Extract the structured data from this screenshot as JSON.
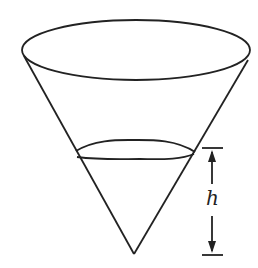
{
  "diagram": {
    "height_label": "h",
    "stroke_color": "#222222",
    "background": "#ffffff"
  }
}
